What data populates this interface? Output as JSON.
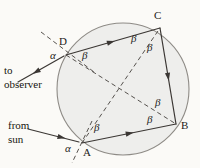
{
  "figure": {
    "name": "circle-geometry-rainbow-ray-path",
    "background_color": "#fbfaf7",
    "ink_color": "#3b3734",
    "circle": {
      "cx": 123,
      "cy": 89,
      "r": 66,
      "fill": "#eeeeec",
      "stroke": "#8e8b86"
    },
    "points": [
      {
        "id": "A",
        "label": "A",
        "x": 82,
        "y": 143,
        "label_x": 84,
        "label_y": 147
      },
      {
        "id": "B",
        "label": "B",
        "x": 176,
        "y": 124,
        "label_x": 182,
        "label_y": 121
      },
      {
        "id": "C",
        "label": "C",
        "x": 160,
        "y": 28,
        "label_x": 154,
        "label_y": 12
      },
      {
        "id": "D",
        "label": "D",
        "x": 66,
        "y": 55,
        "label_x": 60,
        "label_y": 37
      }
    ],
    "angle_labels": [
      {
        "symbol": "α",
        "x": 52,
        "y": 56,
        "near": "D"
      },
      {
        "symbol": "β",
        "x": 82,
        "y": 55,
        "near": "D"
      },
      {
        "symbol": "β",
        "x": 132,
        "y": 34,
        "near": "C"
      },
      {
        "symbol": "β",
        "x": 148,
        "y": 43,
        "near": "C"
      },
      {
        "symbol": "β",
        "x": 155,
        "y": 99,
        "near": "B"
      },
      {
        "symbol": "β",
        "x": 148,
        "y": 117,
        "near": "B"
      },
      {
        "symbol": "β",
        "x": 95,
        "y": 125,
        "near": "A"
      },
      {
        "symbol": "α",
        "x": 66,
        "y": 146,
        "near": "A"
      }
    ],
    "captions": [
      {
        "id": "to-observer",
        "lines": [
          "to",
          "observer"
        ],
        "x": 4,
        "y": 68
      },
      {
        "id": "from-sun",
        "lines": [
          "from",
          "sun"
        ],
        "x": 8,
        "y": 123
      }
    ],
    "solid_edges": [
      {
        "from": "D",
        "to": "C",
        "arrow_at": 0.52
      },
      {
        "from": "C",
        "to": "B",
        "arrow_at": 0.55
      },
      {
        "from": "A",
        "to": "B",
        "arrow_at": 0.55
      }
    ],
    "dashed_chords": [
      {
        "from": "D",
        "to": "B"
      },
      {
        "from": "A",
        "to": "C"
      }
    ],
    "external_rays": [
      {
        "id": "incident-sun-ray",
        "x1": 28,
        "y1": 129,
        "x2": 80,
        "y2": 142,
        "arrow": true,
        "dashed": false
      },
      {
        "id": "emergent-observer-ray",
        "x1": 64,
        "y1": 56,
        "x2": 18,
        "y2": 82,
        "arrow": true,
        "dashed": false
      },
      {
        "id": "normal-at-D",
        "x1": 41,
        "y1": 32,
        "x2": 94,
        "y2": 72,
        "arrow": false,
        "dashed": true
      },
      {
        "id": "normal-at-A",
        "x1": 92,
        "y1": 121,
        "x2": 72,
        "y2": 163,
        "arrow": false,
        "dashed": true
      }
    ]
  }
}
